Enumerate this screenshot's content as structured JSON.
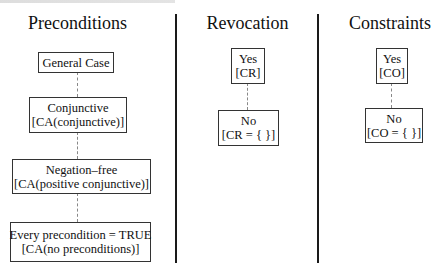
{
  "columns": [
    {
      "title": "Preconditions",
      "nodes": [
        {
          "line1": "General Case",
          "line2": ""
        },
        {
          "line1": "Conjunctive",
          "line2": "[CA(conjunctive)]"
        },
        {
          "line1": "Negation–free",
          "line2": "[CA(positive conjunctive)]"
        },
        {
          "line1": "Every precondition = TRUE",
          "line2": "[CA(no preconditions)]"
        }
      ]
    },
    {
      "title": "Revocation",
      "nodes": [
        {
          "line1": "Yes",
          "line2": "[CR]"
        },
        {
          "line1": "No",
          "line2": "[CR = { }]"
        }
      ]
    },
    {
      "title": "Constraints",
      "nodes": [
        {
          "line1": "Yes",
          "line2": "[CO]"
        },
        {
          "line1": "No",
          "line2": "[CO = { }]"
        }
      ]
    }
  ],
  "colors": {
    "divider": "#1a1a1a",
    "box_border": "#333333",
    "connector": "#888888",
    "text": "#111111"
  }
}
